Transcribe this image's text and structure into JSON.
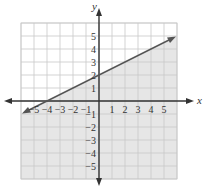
{
  "chart_data": {
    "type": "line",
    "title": "",
    "xlabel": "x",
    "ylabel": "y",
    "xlim": [
      -6,
      6
    ],
    "ylim": [
      -6,
      6
    ],
    "grid": true,
    "x_ticks": [
      "-5",
      "-4",
      "-3",
      "-2",
      "-1",
      "1",
      "2",
      "3",
      "4",
      "5"
    ],
    "y_ticks": [
      "5",
      "4",
      "3",
      "2",
      "1",
      "-1",
      "-2",
      "-3",
      "-4",
      "-5"
    ],
    "series": [
      {
        "name": "boundary line y = 1/2 x + 2",
        "x": [
          -6,
          -4,
          0,
          6
        ],
        "y": [
          -1,
          0,
          2,
          5
        ],
        "style": "solid",
        "arrows": "both"
      }
    ],
    "shaded_region": "below the line (y <= 1/2 x + 2)",
    "colors": {
      "shade": "#e6e6e6",
      "grid": "#c8c8c8",
      "line": "#555555",
      "axes": "#333333"
    }
  }
}
